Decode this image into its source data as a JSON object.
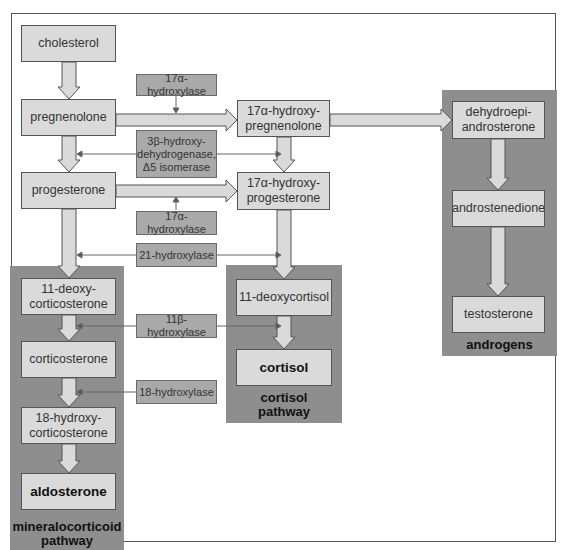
{
  "colors": {
    "node_fill": "#dadada",
    "enzyme_fill": "#a9a9a9",
    "panel_fill": "#8e8e8e",
    "outline": "#555555"
  },
  "nodes": {
    "cholesterol": "cholesterol",
    "pregnenolone": "pregnenolone",
    "progesterone": "progesterone",
    "hydroxypregnenolone_1": "17α-hydroxy-",
    "hydroxypregnenolone_2": "pregnenolone",
    "hydroxyprogesterone_1": "17α-hydroxy-",
    "hydroxyprogesterone_2": "progesterone",
    "dhea_1": "dehydroepi-",
    "dhea_2": "androsterone",
    "androstenedione": "androstenedione",
    "testosterone": "testosterone",
    "deoxycorticosterone_1": "11-deoxy-",
    "deoxycorticosterone_2": "corticosterone",
    "corticosterone": "corticosterone",
    "hydroxycorticosterone_1": "18-hydroxy-",
    "hydroxycorticosterone_2": "corticosterone",
    "aldosterone": "aldosterone",
    "deoxycortisol": "11-deoxycortisol",
    "cortisol": "cortisol"
  },
  "enzymes": {
    "hydroxylase17_top": "17α-hydroxylase",
    "hsd3b_1": "3β-hydroxy-",
    "hsd3b_2": "dehydrogenase,",
    "hsd3b_3": "Δ5 isomerase",
    "hydroxylase17_bottom": "17α-hydroxylase",
    "hydroxylase21": "21-hydroxylase",
    "hydroxylase11b": "11β-hydroxylase",
    "hydroxylase18": "18-hydroxylase"
  },
  "panels": {
    "androgens": "androgens",
    "cortisol_1": "cortisol",
    "cortisol_2": "pathway",
    "mineralo_1": "mineralocorticoid",
    "mineralo_2": "pathway"
  }
}
